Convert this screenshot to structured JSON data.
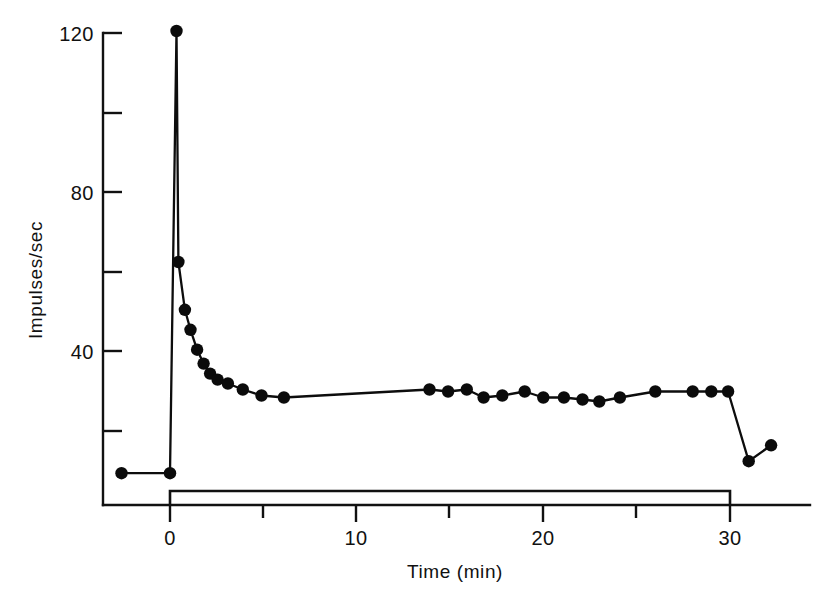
{
  "figure": {
    "background_color": "#ffffff",
    "ink_color": "#111111"
  },
  "chart_data": {
    "type": "line",
    "title": "",
    "subtitle": "",
    "xlabel": "Time  (min)",
    "ylabel": "Impulses/sec",
    "xlim": [
      -4,
      33
    ],
    "ylim": [
      0,
      128
    ],
    "grid": false,
    "legend": "none",
    "x_ticks_major": [
      0,
      10,
      20,
      30
    ],
    "x_tick_labels": [
      "0",
      "10",
      "20",
      "30"
    ],
    "x_ticks_minor": [
      5,
      15,
      25
    ],
    "y_ticks_major": [
      40,
      80,
      120
    ],
    "y_tick_labels": [
      "40",
      "80",
      "120"
    ],
    "y_ticks_minor": [
      20,
      60,
      100
    ],
    "series": [
      {
        "name": "Firing rate",
        "marker": "filled-circle",
        "x": [
          -2.6,
          0.0,
          0.35,
          0.45,
          0.8,
          1.1,
          1.45,
          1.8,
          2.15,
          2.55,
          3.1,
          3.9,
          4.9,
          6.1,
          13.9,
          14.9,
          15.9,
          16.8,
          17.8,
          19.0,
          20.0,
          21.1,
          22.1,
          23.0,
          24.1,
          26.0,
          28.0,
          29.0,
          29.9,
          31.0,
          32.2
        ],
        "y": [
          9.5,
          9.5,
          120.5,
          62.5,
          50.5,
          45.5,
          40.5,
          37.0,
          34.5,
          33.0,
          32.0,
          30.5,
          29.0,
          28.5,
          30.5,
          30.0,
          30.5,
          28.5,
          29.0,
          30.0,
          28.5,
          28.5,
          28.0,
          27.5,
          28.5,
          30.0,
          30.0,
          30.0,
          30.0,
          12.5,
          16.5
        ]
      }
    ],
    "annotations": [
      {
        "name": "drug-application-bar",
        "shape": "step-bar",
        "x_start": 0,
        "x_end": 30,
        "label": ""
      }
    ]
  }
}
